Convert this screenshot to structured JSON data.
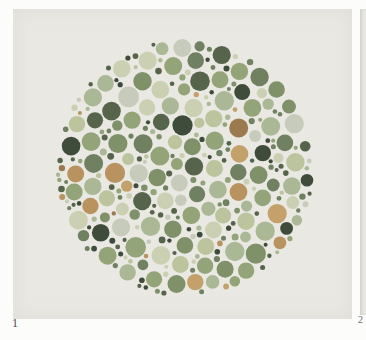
{
  "page": {
    "background_color": "#fcfcfb"
  },
  "plate": {
    "number_label": "1",
    "card_color": "#e9e8e2",
    "card_width": 339,
    "card_height": 310,
    "circle": {
      "cx": 172,
      "cy": 159,
      "r": 130
    },
    "seed": 1337,
    "dot_spacing": 0.9,
    "dot_classes": [
      {
        "name": "large",
        "r_min": 8.0,
        "r_max": 10.5,
        "attempts": 2600
      },
      {
        "name": "medium",
        "r_min": 5.0,
        "r_max": 7.5,
        "attempts": 3600
      },
      {
        "name": "small",
        "r_min": 2.0,
        "r_max": 3.6,
        "attempts": 5200
      }
    ],
    "palette": [
      {
        "color": "#aab896",
        "weight": 14
      },
      {
        "color": "#93a478",
        "weight": 13
      },
      {
        "color": "#bcc49e",
        "weight": 11
      },
      {
        "color": "#ccd0b2",
        "weight": 10
      },
      {
        "color": "#c7cbbb",
        "weight": 7
      },
      {
        "color": "#7f9169",
        "weight": 11
      },
      {
        "color": "#6f8161",
        "weight": 7
      },
      {
        "color": "#55644b",
        "weight": 9
      },
      {
        "color": "#3f4c3c",
        "weight": 9
      },
      {
        "color": "#b8935f",
        "weight": 4
      },
      {
        "color": "#c4a06b",
        "weight": 3
      },
      {
        "color": "#9c7a50",
        "weight": 2
      }
    ],
    "small_dot_dark_bias": {
      "probability": 0.45,
      "colors": [
        "#3f4c3c",
        "#55644b",
        "#6f8161"
      ]
    }
  },
  "next_plate": {
    "number_label": "2",
    "card_color": "#e9e8e2"
  }
}
